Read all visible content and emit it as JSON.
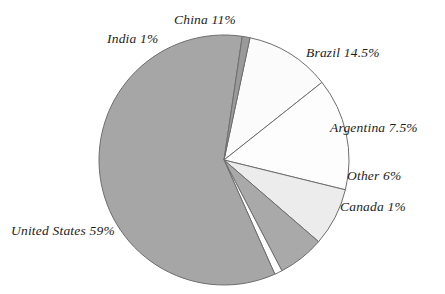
{
  "chart": {
    "title": "",
    "title_cropped": true
  },
  "chart_data": {
    "type": "pie",
    "title": "",
    "xlabel": "",
    "ylabel": "",
    "legend": "none",
    "labels_position": "outside",
    "units": "percent",
    "total": 100,
    "start_angle_deg": -78,
    "direction": "clockwise",
    "categories": [
      "China",
      "Brazil",
      "Argentina",
      "Other",
      "Canada",
      "United States",
      "India"
    ],
    "values": [
      11,
      14.5,
      7.5,
      6,
      1,
      59,
      1
    ],
    "slices": [
      {
        "name": "China",
        "value": 11,
        "label": "China 11%",
        "color": "#fbfbfb"
      },
      {
        "name": "Brazil",
        "value": 14.5,
        "label": "Brazil 14.5%",
        "color": "#fdfdfd"
      },
      {
        "name": "Argentina",
        "value": 7.5,
        "label": "Argentina 7.5%",
        "color": "#ececec"
      },
      {
        "name": "Other",
        "value": 6,
        "label": "Other 6%",
        "color": "#a9a9a9"
      },
      {
        "name": "Canada",
        "value": 1,
        "label": "Canada 1%",
        "color": "#fdfdfd"
      },
      {
        "name": "United States",
        "value": 59,
        "label": "United States 59%",
        "color": "#a6a6a6"
      },
      {
        "name": "India",
        "value": 1,
        "label": "India 1%",
        "color": "#9a9a9a"
      }
    ],
    "stroke_color": "#6e6e6e",
    "background": "#ffffff"
  }
}
